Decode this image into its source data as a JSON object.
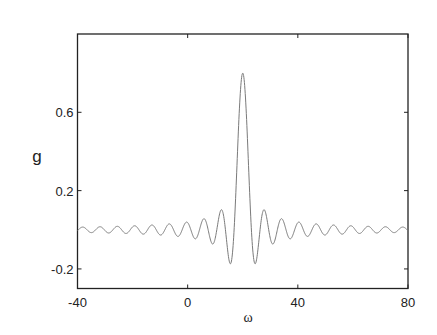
{
  "chart_data": {
    "type": "line",
    "title": "",
    "xlabel": "ω",
    "ylabel": "g",
    "xlim": [
      -40,
      80
    ],
    "ylim": [
      -0.3,
      1.0
    ],
    "xticks": [
      -40,
      0,
      40,
      80
    ],
    "xtick_labels": [
      "-40",
      "0",
      "40",
      "80"
    ],
    "yticks": [
      -0.2,
      0.2,
      0.6
    ],
    "ytick_labels": [
      "-0.2",
      "0.2",
      "0.6"
    ],
    "grid": false,
    "legend": null,
    "series": [
      {
        "name": "g(ω)",
        "description": "sinc-shaped response centered at ω=20, peak ≈0.8, first minima ≈-0.17, ripple period ≈2π",
        "color": "#7a7a7a",
        "x": [
          -40,
          -38,
          -36,
          -34,
          -32,
          -30,
          -28,
          -26,
          -24,
          -22,
          -20,
          -18,
          -16,
          -14,
          -12,
          -10,
          -8,
          -6,
          -4,
          -2,
          0,
          2,
          4,
          6,
          8,
          10,
          12,
          14,
          15.5,
          17,
          18,
          19,
          20,
          21,
          22,
          23,
          24.5,
          26,
          28,
          30,
          32,
          34,
          36,
          38,
          40,
          42,
          44,
          46,
          48,
          50,
          52,
          54,
          56,
          58,
          60,
          62,
          64,
          66,
          68,
          70,
          72,
          74,
          76,
          78,
          80
        ],
        "y": [
          0.004,
          0.004,
          0.005,
          -0.009,
          0.013,
          -0.01,
          0.005,
          0.003,
          -0.012,
          0.017,
          -0.015,
          0.006,
          0.005,
          -0.018,
          0.023,
          -0.018,
          0.004,
          0.012,
          -0.026,
          0.032,
          -0.036,
          0.01,
          0.027,
          -0.06,
          0.073,
          -0.039,
          -0.051,
          0.109,
          -0.168,
          -0.162,
          0.364,
          0.673,
          0.8,
          0.673,
          0.364,
          0.04,
          -0.168,
          0.035,
          0.109,
          -0.051,
          -0.039,
          0.073,
          -0.06,
          0.027,
          0.01,
          -0.036,
          0.032,
          -0.026,
          0.012,
          0.004,
          -0.018,
          0.023,
          -0.018,
          0.005,
          0.006,
          -0.015,
          0.017,
          -0.012,
          0.003,
          0.005,
          -0.01,
          0.013,
          -0.009,
          0.005,
          0.004
        ]
      }
    ],
    "formula_hint": "g ≈ 0.8·sin(ω−20)/(ω−20)"
  }
}
